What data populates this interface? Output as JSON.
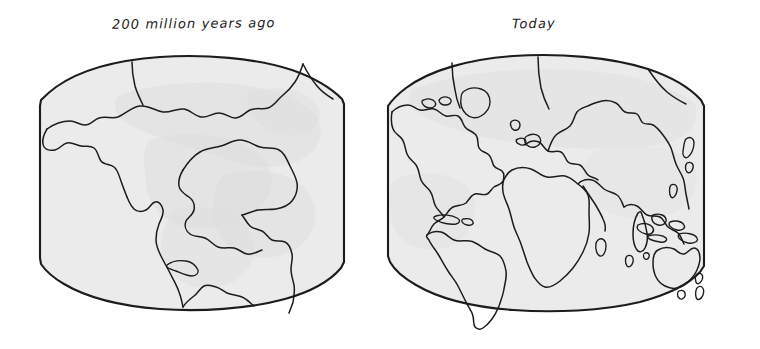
{
  "figure": {
    "background_color": "#ffffff",
    "ink_color": "#1c1c1c",
    "globe_fill_color": "#ebebeb",
    "land_shade_color": "#dcdcdc",
    "style": "hand-drawn pencil and ink sketch"
  },
  "panels": [
    {
      "id": "pangaea",
      "title": "200 million years ago",
      "description": "single supercontinent Pangaea"
    },
    {
      "id": "today",
      "title": "Today",
      "description": "modern continents"
    }
  ],
  "left_panel": {
    "title": "200 million years ago"
  },
  "right_panel": {
    "title": "Today"
  }
}
